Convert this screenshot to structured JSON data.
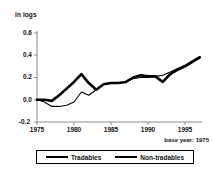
{
  "chart_data": {
    "type": "line",
    "title": "",
    "ylabel": "in logs",
    "xlabel": "",
    "annotation": "base year: 1975",
    "grid": false,
    "legend_position": "bottom",
    "xlim": [
      1975,
      1997
    ],
    "ylim": [
      -0.2,
      0.6
    ],
    "ytick_labels": [
      "0.6",
      "0.4",
      "0.2",
      "0.0",
      "-0.2"
    ],
    "ytick_values": [
      0.6,
      0.4,
      0.2,
      0.0,
      -0.2
    ],
    "xtick_labels": [
      "1975",
      "1980",
      "1985",
      "1990",
      "1995"
    ],
    "xtick_values": [
      1975,
      1980,
      1985,
      1990,
      1995
    ],
    "x": [
      1975,
      1976,
      1977,
      1978,
      1979,
      1980,
      1981,
      1982,
      1983,
      1984,
      1985,
      1986,
      1987,
      1988,
      1989,
      1990,
      1991,
      1992,
      1993,
      1994,
      1995,
      1996,
      1997
    ],
    "series": [
      {
        "name": "Tradables",
        "style": "thick",
        "values": [
          0.0,
          0.0,
          -0.01,
          0.04,
          0.1,
          0.16,
          0.23,
          0.15,
          0.09,
          0.14,
          0.15,
          0.15,
          0.16,
          0.2,
          0.22,
          0.21,
          0.21,
          0.16,
          0.23,
          0.27,
          0.3,
          0.34,
          0.38
        ]
      },
      {
        "name": "Non-tradables",
        "style": "thin",
        "values": [
          0.0,
          -0.02,
          -0.06,
          -0.06,
          -0.05,
          -0.02,
          0.07,
          0.04,
          0.09,
          0.14,
          0.15,
          0.15,
          0.16,
          0.19,
          0.2,
          0.2,
          0.21,
          0.22,
          0.25,
          0.28,
          0.31,
          0.35,
          0.39
        ]
      }
    ]
  },
  "legend": {
    "items": [
      {
        "label": "Tradables",
        "style": "thick"
      },
      {
        "label": "Non-tradables",
        "style": "thin"
      }
    ]
  },
  "colors": {
    "line": "#000000",
    "axis": "#808080",
    "background": "#ffffff"
  }
}
